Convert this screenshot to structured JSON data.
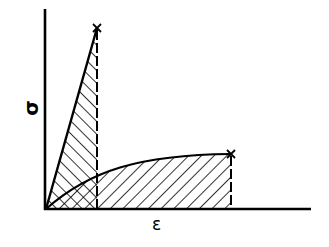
{
  "diagram": {
    "type": "stress-strain curves",
    "axes": {
      "y_label": "σ",
      "x_label": "ε"
    },
    "curves": [
      {
        "name": "brittle",
        "shape": "linear",
        "end_marker": "x",
        "fill": "hatch-backslash"
      },
      {
        "name": "ductile",
        "shape": "rising-plateau",
        "end_marker": "x",
        "fill": "hatch-slash"
      }
    ],
    "overlap_fill": "cross-hatch",
    "colors": {
      "ink": "#000000",
      "background": "#ffffff"
    }
  }
}
